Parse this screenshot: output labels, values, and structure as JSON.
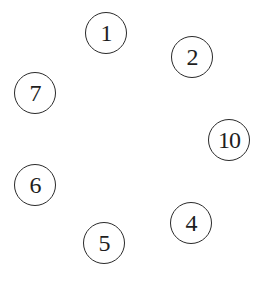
{
  "diagram": {
    "type": "circled-node-ring",
    "width": 272,
    "height": 285,
    "nodes": [
      {
        "label": "1",
        "cx": 106,
        "cy": 33
      },
      {
        "label": "2",
        "cx": 192,
        "cy": 57
      },
      {
        "label": "7",
        "cx": 35,
        "cy": 93
      },
      {
        "label": "10",
        "cx": 229,
        "cy": 140
      },
      {
        "label": "6",
        "cx": 35,
        "cy": 185
      },
      {
        "label": "4",
        "cx": 191,
        "cy": 223
      },
      {
        "label": "5",
        "cx": 104,
        "cy": 243
      }
    ],
    "edges": [],
    "colors": {
      "background": "#ffffff",
      "stroke": "#2a2a2a",
      "text": "#1e1e1e"
    }
  }
}
